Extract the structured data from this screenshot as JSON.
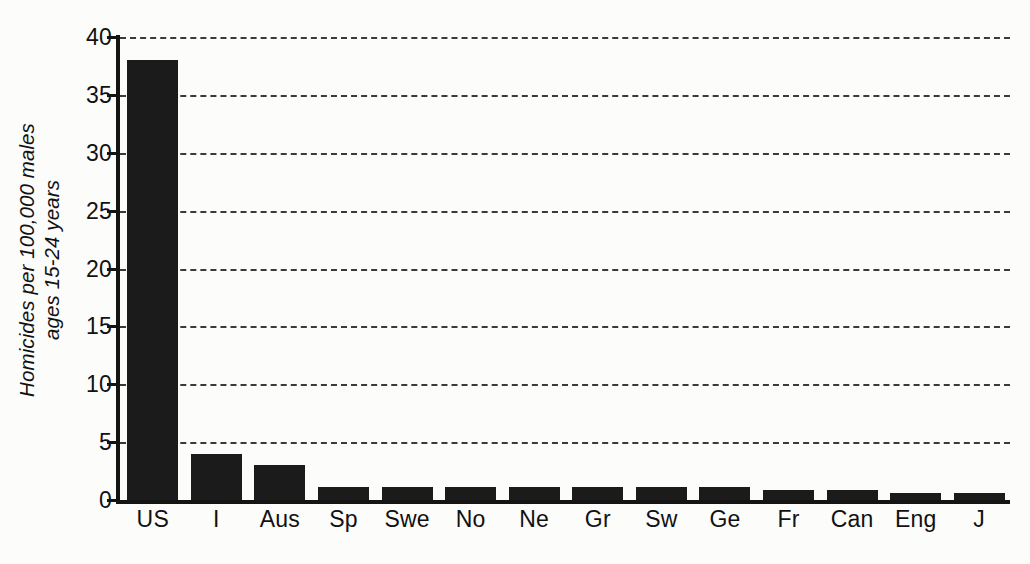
{
  "chart_data": {
    "type": "bar",
    "title": "",
    "xlabel": "",
    "ylabel": "Homicides per 100,000 males ages 15-24 years",
    "ylabel_line1": "Homicides per 100,000 males",
    "ylabel_line2": "ages 15-24 years",
    "categories": [
      "US",
      "I",
      "Aus",
      "Sp",
      "Swe",
      "No",
      "Ne",
      "Gr",
      "Sw",
      "Ge",
      "Fr",
      "Can",
      "Eng",
      "J"
    ],
    "values": [
      38,
      4,
      3,
      1.1,
      1.1,
      1.1,
      1.1,
      1.1,
      1.1,
      1.1,
      0.9,
      0.9,
      0.6,
      0.6
    ],
    "ylim": [
      0,
      40
    ],
    "ytick_labels": [
      "0",
      "5",
      "10",
      "15",
      "20",
      "25",
      "30",
      "35",
      "40"
    ],
    "ytick_values": [
      0,
      5,
      10,
      15,
      20,
      25,
      30,
      35,
      40
    ],
    "grid": true,
    "grid_style": "dashed",
    "legend": "none",
    "bar_color": "#1b1b1b",
    "grid_color": "#3a3a3a",
    "axis_color": "#141414",
    "background_color": "#fcfcfb"
  }
}
